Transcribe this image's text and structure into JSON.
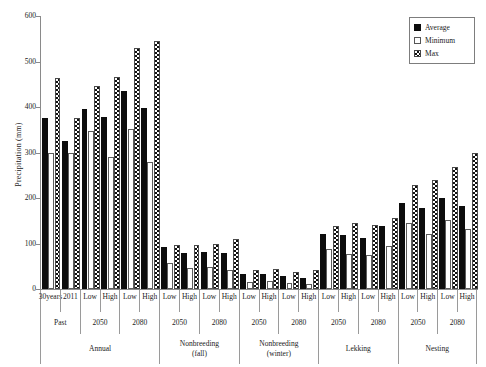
{
  "chart_data": {
    "type": "bar",
    "title": "",
    "xlabel": "",
    "ylabel": "Precipitation (mm)",
    "ylim": [
      0,
      600
    ],
    "yticks": [
      0,
      100,
      200,
      300,
      400,
      500,
      600
    ],
    "grid": false,
    "legend_position": "top-right",
    "legend": [
      "Average",
      "Minimum",
      "Max"
    ],
    "categories": [
      "30 years",
      "2011",
      "Low",
      "High",
      "Low",
      "High",
      "Low",
      "High",
      "Low",
      "High",
      "Low",
      "High",
      "Low",
      "High",
      "Low",
      "High",
      "Low",
      "High",
      "Low",
      "High",
      "Low",
      "High"
    ],
    "series": [
      {
        "name": "Average",
        "values": [
          376,
          325,
          396,
          378,
          435,
          398,
          92,
          80,
          81,
          79,
          32,
          34,
          28,
          24,
          122,
          118,
          113,
          138,
          190,
          177,
          199,
          182
        ]
      },
      {
        "name": "Minimum",
        "values": [
          300,
          298,
          348,
          290,
          352,
          279,
          58,
          46,
          49,
          41,
          16,
          18,
          14,
          12,
          88,
          78,
          74,
          95,
          146,
          122,
          152,
          132
        ]
      },
      {
        "name": "Max",
        "values": [
          463,
          375,
          446,
          466,
          529,
          546,
          97,
          96,
          100,
          109,
          42,
          43,
          38,
          41,
          138,
          146,
          140,
          155,
          228,
          240,
          268,
          299
        ]
      }
    ],
    "group_tiers": {
      "tier1_label": "period",
      "tier2_label": "scenario-year",
      "tier3_label": "season",
      "tier2": [
        {
          "label": "Past",
          "span": 2
        },
        {
          "label": "2050",
          "span": 2
        },
        {
          "label": "2080",
          "span": 2
        },
        {
          "label": "2050",
          "span": 2
        },
        {
          "label": "2080",
          "span": 2
        },
        {
          "label": "2050",
          "span": 2
        },
        {
          "label": "2080",
          "span": 2
        },
        {
          "label": "2050",
          "span": 2
        },
        {
          "label": "2080",
          "span": 2
        },
        {
          "label": "2050",
          "span": 2
        },
        {
          "label": "2080",
          "span": 2
        }
      ],
      "tier3": [
        {
          "label": "Annual",
          "span": 6
        },
        {
          "label": "Nonbreeding (fall)",
          "span": 4
        },
        {
          "label": "Nonbreeding (winter)",
          "span": 4
        },
        {
          "label": "Lekking",
          "span": 4
        },
        {
          "label": "Nesting",
          "span": 4
        }
      ]
    },
    "colors": {
      "average": "#0d0d0d",
      "minimum": "#ffffff",
      "max_pattern": "#111111",
      "axis": "#8a8a8a",
      "text": "#1a1a1a"
    }
  }
}
